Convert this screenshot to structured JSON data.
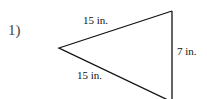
{
  "problem": {
    "number": "1)",
    "shape": "triangle",
    "sides": {
      "top": "15 in.",
      "bottom": "15 in.",
      "right": "7 in."
    }
  }
}
